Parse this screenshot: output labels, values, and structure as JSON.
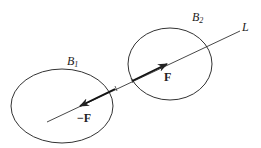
{
  "diagram": {
    "bodies": [
      {
        "label": "B",
        "subscript": "1"
      },
      {
        "label": "B",
        "subscript": "2"
      }
    ],
    "line_label": "L",
    "forces": [
      {
        "label": "F",
        "direction": "toward B2"
      },
      {
        "label": "−F",
        "direction": "toward B1"
      }
    ],
    "colors": {
      "stroke": "#222222",
      "background": "#ffffff"
    }
  }
}
